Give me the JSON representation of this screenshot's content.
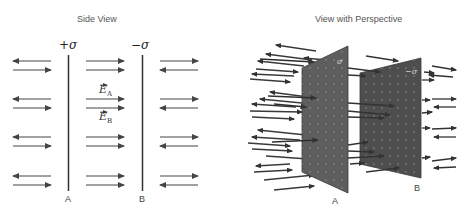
{
  "side_view": {
    "title": "Side View",
    "plate_a": {
      "label": "A",
      "charge": "+σ"
    },
    "plate_b": {
      "label": "B",
      "charge": "−σ"
    },
    "field_labels": {
      "ea_base": "E",
      "ea_sub": "A",
      "eb_base": "E",
      "eb_sub": "B"
    }
  },
  "perspective_view": {
    "title": "View with Perspective",
    "plate_a": {
      "label": "A",
      "charge": "σ"
    },
    "plate_b": {
      "label": "B",
      "charge": "−σ"
    }
  },
  "colors": {
    "plate_line": "#333333",
    "arrow": "#444444",
    "plate_face_a": "#5e5e5e",
    "plate_face_b": "#4e4e4e"
  }
}
